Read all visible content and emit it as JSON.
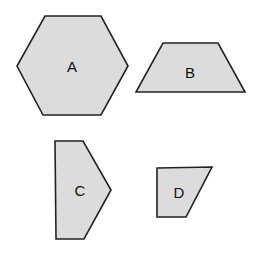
{
  "diagram": {
    "colors": {
      "fill": "#dcdcdc",
      "stroke": "#222222",
      "label": "#111111",
      "background": "#ffffff"
    },
    "shapes": [
      {
        "label": "A",
        "type": "hexagon",
        "points": "45,16 101,16 128,66 101,115 43,115 17,66",
        "label_pos": [
          72,
          66
        ]
      },
      {
        "label": "B",
        "type": "trapezoid",
        "points": "163,43 218,43 245,92 136,92",
        "label_pos": [
          190,
          72
        ]
      },
      {
        "label": "C",
        "type": "pentagon",
        "points": "55,141 83,141 111,190 84,239 56,239",
        "label_pos": [
          80,
          190
        ]
      },
      {
        "label": "D",
        "type": "quadrilateral",
        "points": "157,168 212,167 186,217 157,217",
        "label_pos": [
          179,
          192
        ]
      }
    ]
  }
}
